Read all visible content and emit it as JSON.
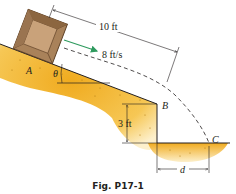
{
  "figure": {
    "caption": "Fig. P17-1",
    "labels": {
      "point_a": "A",
      "point_b": "B",
      "point_c": "C",
      "angle": "θ",
      "distance_slope": "10 ft",
      "velocity": "8 ft/s",
      "height": "3 ft",
      "distance_d": "d"
    },
    "colors": {
      "ground_fill": "#f2b630",
      "ground_light": "#fbe3a0",
      "box_fill": "#a9825a",
      "box_dark": "#6e4f30",
      "arrow": "#2e9a5e",
      "line": "#231f20"
    }
  }
}
